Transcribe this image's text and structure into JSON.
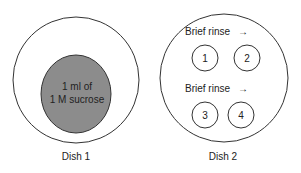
{
  "colors": {
    "stroke": "#333333",
    "sucrose_fill": "#8c8c8c",
    "background": "#ffffff",
    "text": "#222222"
  },
  "dish1": {
    "label": "Dish 1",
    "solution_line1": "1 ml of",
    "solution_line2": "1 M sucrose"
  },
  "dish2": {
    "label": "Dish 2",
    "rinse_rows": [
      {
        "label": "Brief rinse",
        "arrow": "→"
      },
      {
        "label": "Brief rinse",
        "arrow": "→"
      }
    ],
    "wells": [
      "1",
      "2",
      "3",
      "4"
    ]
  }
}
